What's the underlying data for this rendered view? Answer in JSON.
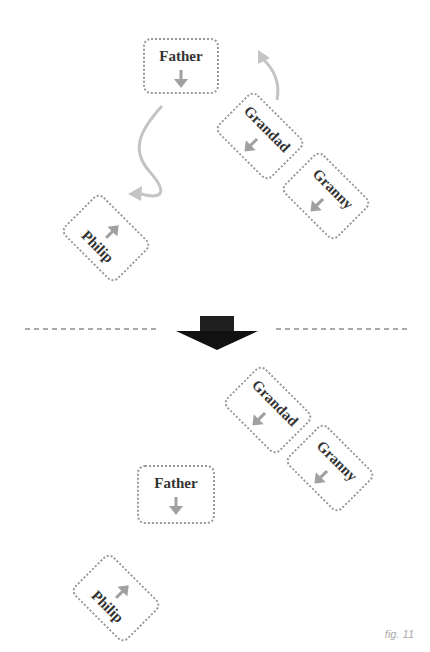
{
  "figure": {
    "caption": "fig. 11",
    "colors": {
      "card_border": "#9a9a9a",
      "arrow_gray": "#a0a0a0",
      "label_text": "#333333",
      "big_arrow": "#1a1a1a",
      "divider": "#555555"
    }
  },
  "before": {
    "cards": [
      {
        "id": "father",
        "label": "Father",
        "arrow": "down"
      },
      {
        "id": "grandad",
        "label": "Grandad",
        "arrow": "down-left"
      },
      {
        "id": "granny",
        "label": "Granny",
        "arrow": "down-left"
      },
      {
        "id": "philip",
        "label": "Philip",
        "arrow": "up-right"
      }
    ]
  },
  "after": {
    "cards": [
      {
        "id": "father",
        "label": "Father",
        "arrow": "down"
      },
      {
        "id": "grandad",
        "label": "Grandad",
        "arrow": "down-left"
      },
      {
        "id": "granny",
        "label": "Granny",
        "arrow": "down-left"
      },
      {
        "id": "philip",
        "label": "Philip",
        "arrow": "up-right"
      }
    ]
  }
}
